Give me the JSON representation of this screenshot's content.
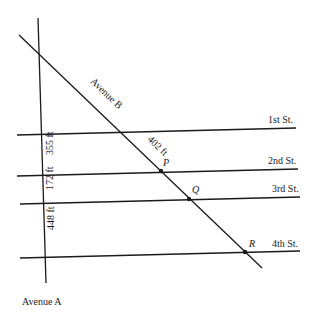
{
  "diagram": {
    "avenues": [
      {
        "name": "Avenue A",
        "x1": 38,
        "y1": 18,
        "x2": 46,
        "y2": 283,
        "label_x": 22,
        "label_y": 305
      },
      {
        "name": "Avenue B",
        "x1": 19,
        "y1": 35,
        "x2": 262,
        "y2": 268,
        "label_x": 90,
        "label_y": 82,
        "label_angle": 43.8
      }
    ],
    "streets": [
      {
        "name": "1st St.",
        "x1": 17,
        "y1": 135,
        "x2": 296,
        "y2": 128,
        "label_x": 268,
        "label_y": 123
      },
      {
        "name": "2nd St.",
        "x1": 17,
        "y1": 176,
        "x2": 298,
        "y2": 169,
        "label_x": 268,
        "label_y": 164
      },
      {
        "name": "3rd St.",
        "x1": 20,
        "y1": 204,
        "x2": 300,
        "y2": 197,
        "label_x": 272,
        "label_y": 192
      },
      {
        "name": "4th St.",
        "x1": 20,
        "y1": 258,
        "x2": 300,
        "y2": 251,
        "label_x": 272,
        "label_y": 247
      }
    ],
    "points": [
      {
        "label": "P",
        "x": 161,
        "y": 171,
        "label_x": 163,
        "label_y": 166
      },
      {
        "label": "Q",
        "x": 189,
        "y": 199,
        "label_x": 192,
        "label_y": 193
      },
      {
        "label": "R",
        "x": 245,
        "y": 252,
        "label_x": 249,
        "label_y": 247
      }
    ],
    "measurements": [
      {
        "text": "355 ft",
        "x": 53,
        "y": 155,
        "angle": -90
      },
      {
        "text": "172 ft",
        "x": 53,
        "y": 190,
        "angle": -90
      },
      {
        "text": "448 ft",
        "x": 54,
        "y": 230,
        "angle": -90
      },
      {
        "text": "402 ft",
        "x": 147,
        "y": 140,
        "angle": 43.8
      }
    ],
    "line_color": "#1a1a1a"
  }
}
